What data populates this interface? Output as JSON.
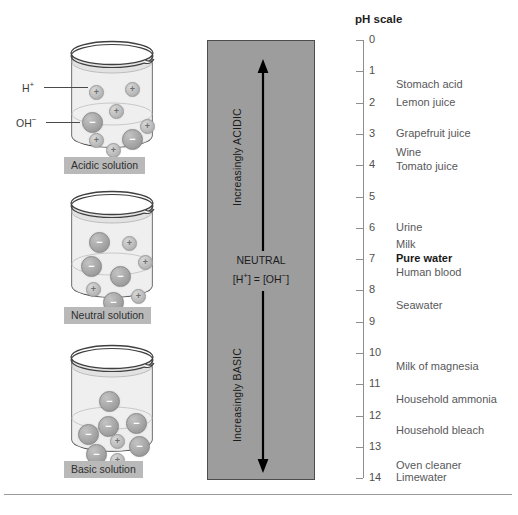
{
  "figure": {
    "ph_scale_title": "pH scale"
  },
  "beakers": [
    {
      "caption": "Acidic solution",
      "pointer_labels": [
        {
          "text": "H",
          "charge": "+",
          "name": "hydrogen-ion-label"
        },
        {
          "text": "OH",
          "charge": "−",
          "name": "hydroxide-ion-label"
        }
      ],
      "ions": [
        {
          "sign": "+",
          "size": "small",
          "x": 29,
          "y": 31
        },
        {
          "sign": "+",
          "size": "small",
          "x": 65,
          "y": 28
        },
        {
          "sign": "+",
          "size": "small",
          "x": 49,
          "y": 50
        },
        {
          "sign": "−",
          "size": "big",
          "x": 22,
          "y": 58
        },
        {
          "sign": "+",
          "size": "small",
          "x": 80,
          "y": 65
        },
        {
          "sign": "−",
          "size": "big",
          "x": 62,
          "y": 75
        },
        {
          "sign": "+",
          "size": "small",
          "x": 29,
          "y": 79
        },
        {
          "sign": "+",
          "size": "small",
          "x": 46,
          "y": 89
        }
      ]
    },
    {
      "caption": "Neutral solution",
      "pointer_labels": [],
      "ions": [
        {
          "sign": "−",
          "size": "big",
          "x": 29,
          "y": 28
        },
        {
          "sign": "+",
          "size": "small",
          "x": 62,
          "y": 32
        },
        {
          "sign": "−",
          "size": "big",
          "x": 21,
          "y": 52
        },
        {
          "sign": "+",
          "size": "small",
          "x": 78,
          "y": 51
        },
        {
          "sign": "−",
          "size": "big",
          "x": 50,
          "y": 62
        },
        {
          "sign": "+",
          "size": "small",
          "x": 26,
          "y": 78
        },
        {
          "sign": "−",
          "size": "big",
          "x": 43,
          "y": 88
        },
        {
          "sign": "+",
          "size": "small",
          "x": 71,
          "y": 85
        }
      ]
    },
    {
      "caption": "Basic solution",
      "pointer_labels": [],
      "ions": [
        {
          "sign": "−",
          "size": "big",
          "x": 39,
          "y": 33
        },
        {
          "sign": "−",
          "size": "big",
          "x": 38,
          "y": 58
        },
        {
          "sign": "−",
          "size": "big",
          "x": 66,
          "y": 55
        },
        {
          "sign": "−",
          "size": "big",
          "x": 18,
          "y": 66
        },
        {
          "sign": "+",
          "size": "small",
          "x": 50,
          "y": 76
        },
        {
          "sign": "−",
          "size": "big",
          "x": 69,
          "y": 78
        },
        {
          "sign": "−",
          "size": "big",
          "x": 26,
          "y": 86
        },
        {
          "sign": "+",
          "size": "small",
          "x": 50,
          "y": 95
        }
      ]
    }
  ],
  "column": {
    "acidic_label": "Increasingly ACIDIC",
    "basic_label": "Increasingly BASIC",
    "neutral_title": "NEUTRAL",
    "neutral_formula_left": "[H",
    "neutral_formula_left_sup": "+",
    "neutral_formula_mid": "] = [OH",
    "neutral_formula_right_sup": "−",
    "neutral_formula_end": "]",
    "fill_color": "#9d9d9d",
    "arrow_color": "#000000"
  },
  "ph_axis": {
    "min": 0,
    "max": 14,
    "ticks": [
      "0",
      "1",
      "2",
      "3",
      "4",
      "5",
      "6",
      "7",
      "8",
      "9",
      "10",
      "11",
      "12",
      "13",
      "14"
    ]
  },
  "substances": [
    {
      "label": "Stomach acid",
      "ph": 1.45,
      "bold": false
    },
    {
      "label": "Lemon juice",
      "ph": 2.0,
      "bold": false
    },
    {
      "label": "Grapefruit juice",
      "ph": 3.0,
      "bold": false
    },
    {
      "label": "Wine",
      "ph": 3.62,
      "bold": false
    },
    {
      "label": "Tomato juice",
      "ph": 4.05,
      "bold": false
    },
    {
      "label": "Urine",
      "ph": 6.0,
      "bold": false
    },
    {
      "label": "Milk",
      "ph": 6.55,
      "bold": false
    },
    {
      "label": "Pure water",
      "ph": 7.0,
      "bold": true
    },
    {
      "label": "Human blood",
      "ph": 7.45,
      "bold": false
    },
    {
      "label": "Seawater",
      "ph": 8.5,
      "bold": false
    },
    {
      "label": "Milk of magnesia",
      "ph": 10.45,
      "bold": false
    },
    {
      "label": "Household ammonia",
      "ph": 11.5,
      "bold": false
    },
    {
      "label": "Household bleach",
      "ph": 12.5,
      "bold": false
    },
    {
      "label": "Oven cleaner",
      "ph": 13.6,
      "bold": false
    },
    {
      "label": "Limewater",
      "ph": 14.0,
      "bold": false
    }
  ]
}
